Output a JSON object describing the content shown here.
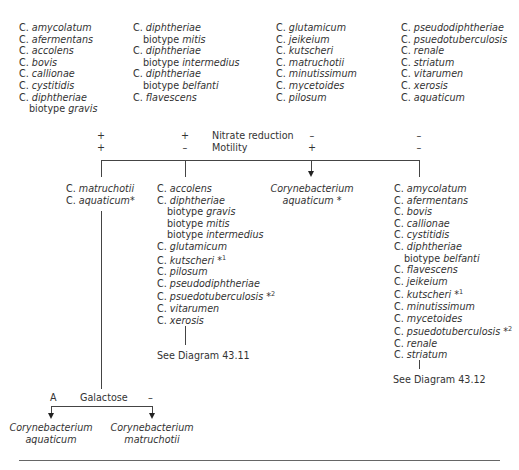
{
  "species_list": {
    "columns": [
      [
        {
          "genus": "C.",
          "species": "amycolatum"
        },
        {
          "genus": "C.",
          "species": "afermentans"
        },
        {
          "genus": "C.",
          "species": "accolens"
        },
        {
          "genus": "C.",
          "species": "bovis"
        },
        {
          "genus": "C.",
          "species": "callionae"
        },
        {
          "genus": "C.",
          "species": "cystitidis"
        },
        {
          "genus": "C.",
          "species": "diphtheriae",
          "biotype_prefix": "biotype",
          "biotype": "gravis"
        }
      ],
      [
        {
          "genus": "C.",
          "species": "diphtheriae",
          "biotype_prefix": "biotype",
          "biotype": "mitis"
        },
        {
          "genus": "C.",
          "species": "diphtheriae",
          "biotype_prefix": "biotype",
          "biotype": "intermedius"
        },
        {
          "genus": "C.",
          "species": "diphtheriae",
          "biotype_prefix": "biotype",
          "biotype": "belfanti"
        },
        {
          "genus": "C.",
          "species": "flavescens"
        }
      ],
      [
        {
          "genus": "C.",
          "species": "glutamicum"
        },
        {
          "genus": "C.",
          "species": "jeikeium"
        },
        {
          "genus": "C.",
          "species": "kutscheri"
        },
        {
          "genus": "C.",
          "species": "matruchotii"
        },
        {
          "genus": "C.",
          "species": "minutissimum"
        },
        {
          "genus": "C.",
          "species": "mycetoides"
        },
        {
          "genus": "C.",
          "species": "pilosum"
        }
      ],
      [
        {
          "genus": "C.",
          "species": "pseudodiphtheriae"
        },
        {
          "genus": "C.",
          "species": "psuedotuberculosis"
        },
        {
          "genus": "C.",
          "species": "renale"
        },
        {
          "genus": "C.",
          "species": "striatum"
        },
        {
          "genus": "C.",
          "species": "vitarumen"
        },
        {
          "genus": "C.",
          "species": "xerosis"
        },
        {
          "genus": "C.",
          "species": "aquaticum"
        }
      ]
    ]
  },
  "tests": {
    "row1": {
      "label": "Nitrate reduction",
      "values": [
        "+",
        "+",
        "–",
        "–"
      ]
    },
    "row2": {
      "label": "Motility",
      "values": [
        "+",
        "–",
        "+",
        "–"
      ]
    }
  },
  "branches": {
    "b1": {
      "lines": [
        {
          "genus": "C.",
          "species": "matruchotii",
          "note": ""
        },
        {
          "genus": "C.",
          "species": "aquaticum",
          "note": "*"
        }
      ]
    },
    "b2": {
      "lines": [
        {
          "genus": "C.",
          "species": "accolens",
          "note": ""
        },
        {
          "genus": "C.",
          "species": "diphtheriae",
          "note": ""
        },
        {
          "biotype_prefix": "biotype",
          "biotype": "gravis"
        },
        {
          "biotype_prefix": "biotype",
          "biotype": "mitis"
        },
        {
          "biotype_prefix": "biotype",
          "biotype": "intermedius"
        },
        {
          "genus": "C.",
          "species": "glutamicum",
          "note": ""
        },
        {
          "genus": "C.",
          "species": "kutscheri",
          "note": "*",
          "sup": "1"
        },
        {
          "genus": "C.",
          "species": "pilosum",
          "note": ""
        },
        {
          "genus": "C.",
          "species": "pseudodiphtheriae",
          "note": ""
        },
        {
          "genus": "C.",
          "species": "psuedotuberculosis",
          "note": "*",
          "sup": "2"
        },
        {
          "genus": "C.",
          "species": "vitarumen",
          "note": ""
        },
        {
          "genus": "C.",
          "species": "xerosis",
          "note": ""
        }
      ],
      "reference": "See Diagram 43.11"
    },
    "b3": {
      "line1": "Corynebacterium",
      "line2": "aquaticum",
      "note": "*"
    },
    "b4": {
      "lines": [
        {
          "genus": "C.",
          "species": "amycolatum",
          "note": ""
        },
        {
          "genus": "C.",
          "species": "afermentans",
          "note": ""
        },
        {
          "genus": "C.",
          "species": "bovis",
          "note": ""
        },
        {
          "genus": "C.",
          "species": "callionae",
          "note": ""
        },
        {
          "genus": "C.",
          "species": "cystitidis",
          "note": ""
        },
        {
          "genus": "C.",
          "species": "diphtheriae",
          "note": ""
        },
        {
          "biotype_prefix": "biotype",
          "biotype": "belfanti"
        },
        {
          "genus": "C.",
          "species": "flavescens",
          "note": ""
        },
        {
          "genus": "C.",
          "species": "jeikeium",
          "note": ""
        },
        {
          "genus": "C.",
          "species": "kutscheri",
          "note": "*",
          "sup": "1"
        },
        {
          "genus": "C.",
          "species": "minutissimum",
          "note": ""
        },
        {
          "genus": "C.",
          "species": "mycetoides",
          "note": ""
        },
        {
          "genus": "C.",
          "species": "psuedotuberculosis",
          "note": "*",
          "sup": "2"
        },
        {
          "genus": "C.",
          "species": "renale",
          "note": ""
        },
        {
          "genus": "C.",
          "species": "striatum",
          "note": ""
        }
      ],
      "reference": "See Diagram 43.12"
    }
  },
  "galactose": {
    "left_value": "A",
    "label": "Galactose",
    "right_value": "–",
    "left_result": {
      "line1": "Corynebacterium",
      "line2": "aquaticum"
    },
    "right_result": {
      "line1": "Corynebacterium",
      "line2": "matruchotii"
    }
  }
}
